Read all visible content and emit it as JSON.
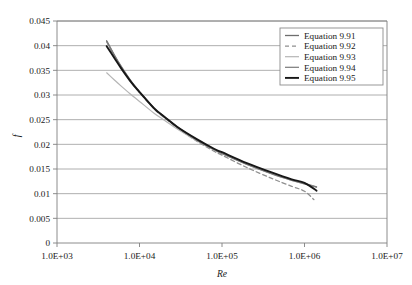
{
  "chart_data": {
    "type": "line",
    "title": "",
    "xlabel": "Re",
    "ylabel": "f",
    "xscale": "log",
    "yscale": "linear",
    "xlim": [
      1000,
      10000000
    ],
    "ylim": [
      0,
      0.045
    ],
    "xticks": [
      "1.0E+03",
      "1.0E+04",
      "1.0E+05",
      "1.0E+06",
      "1.0E+07"
    ],
    "xtick_values": [
      1000,
      10000,
      100000,
      1000000,
      10000000
    ],
    "yticks": [
      "0",
      "0.005",
      "0.01",
      "0.015",
      "0.02",
      "0.025",
      "0.03",
      "0.035",
      "0.04",
      "0.045"
    ],
    "ytick_values": [
      0,
      0.005,
      0.01,
      0.015,
      0.02,
      0.025,
      0.03,
      0.035,
      0.04,
      0.045
    ],
    "grid": "horizontal",
    "legend_position": "top-right",
    "series": [
      {
        "name": "Equation 9.91",
        "color": "#6e6e6e",
        "width": 1.3,
        "dash": "none",
        "x": [
          4000,
          5000,
          6000,
          8000,
          10000,
          15000,
          20000,
          30000,
          50000,
          80000,
          100000,
          200000,
          400000,
          700000,
          1000000,
          1400000
        ],
        "y": [
          0.041,
          0.038,
          0.0358,
          0.0327,
          0.0307,
          0.0274,
          0.0256,
          0.0233,
          0.0209,
          0.019,
          0.0182,
          0.016,
          0.0141,
          0.0128,
          0.0121,
          0.0114
        ]
      },
      {
        "name": "Equation 9.92",
        "color": "#8f8f8f",
        "width": 1.3,
        "dash": "4,3",
        "x": [
          4000,
          5000,
          6000,
          8000,
          10000,
          15000,
          20000,
          30000,
          50000,
          80000,
          100000,
          200000,
          400000,
          700000,
          1000000,
          1300000
        ],
        "y": [
          0.0408,
          0.0378,
          0.0356,
          0.0325,
          0.0305,
          0.0272,
          0.0254,
          0.0231,
          0.0206,
          0.0186,
          0.0178,
          0.0153,
          0.0131,
          0.0115,
          0.0105,
          0.0088
        ]
      },
      {
        "name": "Equation 9.93",
        "color": "#b5b5b5",
        "width": 1.2,
        "dash": "none",
        "x": [
          4000,
          5000,
          6000,
          8000,
          10000,
          15000,
          20000,
          30000,
          50000,
          80000,
          100000,
          200000,
          400000,
          700000,
          1000000,
          1300000
        ],
        "y": [
          0.0345,
          0.033,
          0.0318,
          0.03,
          0.0287,
          0.0263,
          0.0249,
          0.0229,
          0.0207,
          0.0189,
          0.0182,
          0.016,
          0.0141,
          0.0127,
          0.012,
          0.0114
        ]
      },
      {
        "name": "Equation 9.94",
        "color": "#7a7a7a",
        "width": 1.2,
        "dash": "none",
        "x": [
          4000,
          5000,
          6000,
          8000,
          10000,
          15000,
          20000,
          30000,
          50000,
          80000,
          100000,
          200000,
          400000,
          700000,
          1000000,
          1400000
        ],
        "y": [
          0.0409,
          0.0379,
          0.0357,
          0.0326,
          0.0306,
          0.0273,
          0.0255,
          0.0232,
          0.0208,
          0.0189,
          0.0181,
          0.0159,
          0.014,
          0.0127,
          0.012,
          0.0113
        ]
      },
      {
        "name": "Equation 9.95",
        "color": "#171717",
        "width": 1.9,
        "dash": "none",
        "x": [
          4000,
          5000,
          6000,
          8000,
          10000,
          15000,
          20000,
          30000,
          50000,
          80000,
          100000,
          200000,
          400000,
          700000,
          1000000,
          1400000
        ],
        "y": [
          0.0399,
          0.0374,
          0.0354,
          0.0325,
          0.0306,
          0.0273,
          0.0256,
          0.0233,
          0.021,
          0.0191,
          0.0184,
          0.0162,
          0.0143,
          0.0129,
          0.0122,
          0.0106
        ]
      }
    ]
  }
}
